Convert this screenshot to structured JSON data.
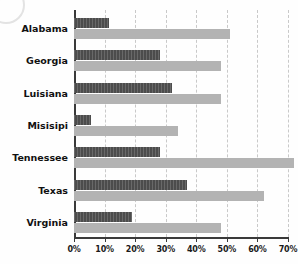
{
  "chart_data": {
    "type": "bar",
    "orientation": "horizontal",
    "grouped": true,
    "title": "",
    "subtitle": "",
    "xlabel": "",
    "ylabel": "",
    "xlim": [
      0,
      70
    ],
    "grid": "vertical-dashed",
    "legend": "none",
    "categories": [
      "Alabama",
      "Georgia",
      "Luisiana",
      "Misisipi",
      "Tennessee",
      "Texas",
      "Virginia"
    ],
    "tick_labels": [
      "0%",
      "10%",
      "20%",
      "30%",
      "40%",
      "50%",
      "60%",
      "70%"
    ],
    "tick_values": [
      0,
      10,
      20,
      30,
      40,
      50,
      60,
      70
    ],
    "series": [
      {
        "name": "series-dark",
        "color": "#4c4c4c",
        "values": [
          11.5,
          28,
          32,
          5.5,
          28,
          37,
          19
        ]
      },
      {
        "name": "series-light",
        "color": "#b3b3b3",
        "values": [
          51,
          48,
          48,
          34,
          72,
          62,
          48
        ]
      }
    ]
  },
  "axis": {
    "x_tick_suffix": "%"
  }
}
